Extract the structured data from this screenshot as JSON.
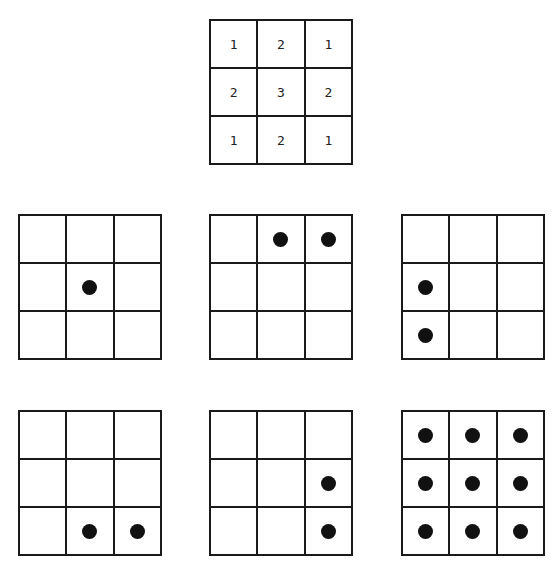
{
  "key_grid": {
    "position": {
      "x": 209,
      "y": 19
    },
    "values": [
      "1",
      "2",
      "1",
      "2",
      "3",
      "2",
      "1",
      "2",
      "1"
    ]
  },
  "pattern_grids": [
    {
      "id": "a",
      "x": 18,
      "y": 214,
      "dots": [
        4
      ]
    },
    {
      "id": "b",
      "x": 209,
      "y": 214,
      "dots": [
        1,
        2
      ]
    },
    {
      "id": "c",
      "x": 401,
      "y": 214,
      "dots": [
        3,
        6
      ]
    },
    {
      "id": "d",
      "x": 18,
      "y": 410,
      "dots": [
        7,
        8
      ]
    },
    {
      "id": "e",
      "x": 209,
      "y": 410,
      "dots": [
        5,
        8
      ]
    },
    {
      "id": "f",
      "x": 401,
      "y": 410,
      "dots": [
        0,
        1,
        2,
        3,
        4,
        5,
        6,
        7,
        8
      ]
    }
  ],
  "colors": {
    "line": "#1a1a1a",
    "dot": "#111111",
    "background": "#ffffff"
  }
}
